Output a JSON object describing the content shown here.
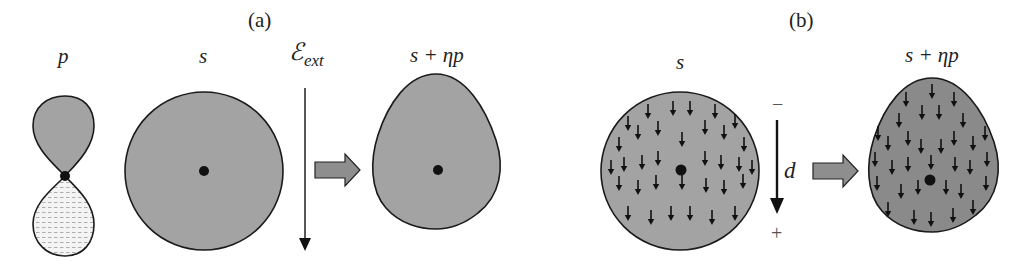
{
  "panels": [
    {
      "id": "a",
      "label": "(a)",
      "orbital_p_label": "p",
      "orbital_s_label": "s",
      "field_label": "ℰ",
      "field_subscript": "ext",
      "result_label": "s + ηp"
    },
    {
      "id": "b",
      "label": "(b)",
      "orbital_s_label": "s",
      "dipole_label": "d",
      "minus_sign": "−",
      "plus_sign": "+",
      "result_label": "s + ηp"
    }
  ],
  "colors": {
    "fill_gray": "#a3a3a3",
    "fill_dark_gray": "#8a8a8a",
    "outline": "#1a1a1a",
    "hatch_fill": "#f2f2f2",
    "arrow_fill": "#8e8e8e"
  }
}
